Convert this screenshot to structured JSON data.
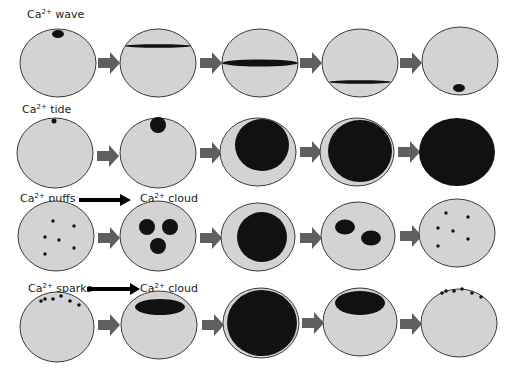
{
  "colors": {
    "cell_fill": "#d3d3d3",
    "cell_stroke": "#3a3a3a",
    "calcium": "#111111",
    "arrow": "#5f5f5f",
    "background": "#ffffff"
  },
  "rows": [
    {
      "id": "wave",
      "label_base": "Ca",
      "label_sup": "2+",
      "label_text": " wave",
      "cy": 62
    },
    {
      "id": "tide",
      "label_base": "Ca",
      "label_sup": "2+",
      "label_text": " tide",
      "cy": 153
    },
    {
      "id": "puffs",
      "label_base": "Ca",
      "label_sup": "2+",
      "label_text": " puffs",
      "cy": 237,
      "target_label_base": "Ca",
      "target_label_sup": "2+",
      "target_label_text": " cloud"
    },
    {
      "id": "sparks",
      "label_base": "Ca",
      "label_sup": "2+",
      "label_text": " sparks",
      "cy": 326,
      "target_label_base": "Ca",
      "target_label_sup": "2+",
      "target_label_text": " cloud"
    }
  ],
  "columns_cx": [
    58,
    158,
    260,
    360,
    460
  ],
  "stages_per_row": 5,
  "arrows_per_row": 4
}
